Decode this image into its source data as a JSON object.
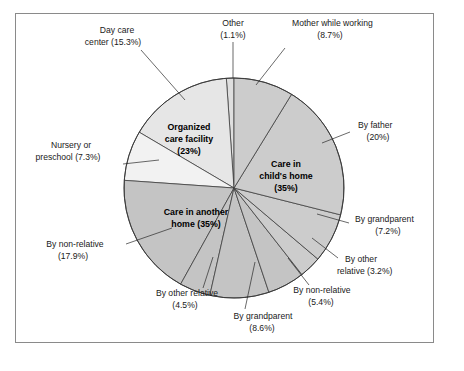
{
  "figure": {
    "title": "",
    "border_color": "#8a8a8a",
    "background": "#ffffff"
  },
  "chart_data": {
    "type": "pie",
    "title": "",
    "subtitle": "",
    "xlabel": "",
    "ylabel": "",
    "legend_position": "none",
    "grid": false,
    "units": "percent",
    "start_angle_deg": 0,
    "direction": "clockwise",
    "groups": [
      {
        "name": "Care in child's home",
        "label": "Care in child's home",
        "percent_label": "(35%)",
        "value": 35,
        "color": "#cccccc"
      },
      {
        "name": "Care in another home",
        "label": "Care in another home",
        "percent_label": "(35%)",
        "value": 35,
        "color": "#c4c4c4"
      },
      {
        "name": "Organized care facility",
        "label": "Organized care facility",
        "percent_label": "(23%)",
        "value": 23,
        "color": "#e6e6e6"
      }
    ],
    "categories": [
      "Mother while working",
      "By father",
      "By grandparent",
      "By other relative",
      "By non-relative",
      "By grandparent",
      "By other relative",
      "By non-relative",
      "Nursery or preschool",
      "Day care center",
      "Other"
    ],
    "values": [
      8.7,
      20,
      7.2,
      3.2,
      5.4,
      8.6,
      4.5,
      17.9,
      7.3,
      15.3,
      1.1
    ],
    "slices": [
      {
        "id": "mother-while-working",
        "label": "Mother while working",
        "percent_label": "(8.7%)",
        "value": 8.7,
        "group": "Care in child's home",
        "color": "#cccccc"
      },
      {
        "id": "by-father",
        "label": "By father",
        "percent_label": "(20%)",
        "value": 20,
        "group": "Care in child's home",
        "color": "#cccccc"
      },
      {
        "id": "by-grandparent-child-home",
        "label": "By grandparent",
        "percent_label": "(7.2%)",
        "value": 7.2,
        "group": "Care in child's home",
        "color": "#cccccc"
      },
      {
        "id": "by-other-relative-child-home",
        "label": "By other relative",
        "percent_label": "(3.2%)",
        "value": 3.2,
        "group": "Care in child's home",
        "color": "#cccccc"
      },
      {
        "id": "by-non-relative-child-home",
        "label": "By non-relative",
        "percent_label": "(5.4%)",
        "value": 5.4,
        "group": "Care in another home",
        "color": "#c4c4c4"
      },
      {
        "id": "by-grandparent-another-home",
        "label": "By grandparent",
        "percent_label": "(8.6%)",
        "value": 8.6,
        "group": "Care in another home",
        "color": "#c4c4c4"
      },
      {
        "id": "by-other-relative-another-home",
        "label": "By other relative",
        "percent_label": "(4.5%)",
        "value": 4.5,
        "group": "Care in another home",
        "color": "#c4c4c4"
      },
      {
        "id": "by-non-relative-another-home",
        "label": "By non-relative",
        "percent_label": "(17.9%)",
        "value": 17.9,
        "group": "Care in another home",
        "color": "#c4c4c4"
      },
      {
        "id": "nursery-or-preschool",
        "label": "Nursery or preschool",
        "percent_label": "(7.3%)",
        "value": 7.3,
        "group": "Organized care facility",
        "color": "#f2f2f2"
      },
      {
        "id": "day-care-center",
        "label": "Day care center",
        "percent_label": "(15.3%)",
        "value": 15.3,
        "group": "Organized care facility",
        "color": "#e6e6e6"
      },
      {
        "id": "other",
        "label": "Other",
        "percent_label": "(1.1%)",
        "value": 1.1,
        "group": "Other",
        "color": "#dedede"
      }
    ]
  },
  "labels": {
    "other_line1": "Other",
    "other_line2": "(1.1%)",
    "mother_line1": "Mother while working",
    "mother_line2": "(8.7%)",
    "father_line1": "By father",
    "father_line2": "(20%)",
    "grandparent_right_line1": "By grandparent",
    "grandparent_right_line2": "(7.2%)",
    "other_relative_right_line1": "By other",
    "other_relative_right_line2": "relative (3.2%)",
    "non_relative_bottom_line1": "By non-relative",
    "non_relative_bottom_line2": "(5.4%)",
    "grandparent_bottom_line1": "By grandparent",
    "grandparent_bottom_line2": "(8.6%)",
    "other_relative_bottom_line1": "By other relative",
    "other_relative_bottom_line2": "(4.5%)",
    "non_relative_left_line1": "By non-relative",
    "non_relative_left_line2": "(17.9%)",
    "nursery_line1": "Nursery or",
    "nursery_line2": "preschool (7.3%)",
    "daycare_line1": "Day care",
    "daycare_line2": "center (15.3%)",
    "group_child_home_line1": "Care in",
    "group_child_home_line2": "child's home",
    "group_child_home_line3": "(35%)",
    "group_another_home_line1": "Care in another",
    "group_another_home_line2": "home (35%)",
    "group_organized_line1": "Organized",
    "group_organized_line2": "care facility",
    "group_organized_line3": "(23%)"
  }
}
